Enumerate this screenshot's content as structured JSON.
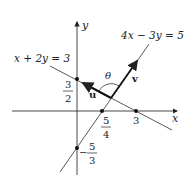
{
  "diagram": {
    "axes": {
      "x_label": "x",
      "y_label": "y"
    },
    "lines": [
      {
        "equation": "x + 2y = 3"
      },
      {
        "equation": "4x − 3y = 5"
      }
    ],
    "vectors": {
      "u": "u",
      "v": "v"
    },
    "angle_label": "θ",
    "points": {
      "y_int_line1": {
        "num": "3",
        "den": "2"
      },
      "x_int_line2": {
        "num": "5",
        "den": "4"
      },
      "x_int_line1": "3",
      "y_int_line2": {
        "sign": "−",
        "num": "5",
        "den": "3"
      }
    }
  }
}
